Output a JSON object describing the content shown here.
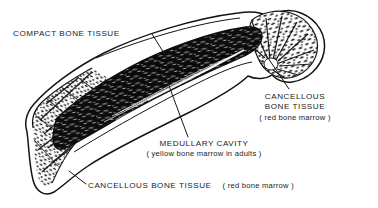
{
  "figure": {
    "kind": "anatomical-line-drawing",
    "width": 378,
    "height": 208,
    "background_color": "#ffffff",
    "ink_color": "#1a1a1a"
  },
  "labels": {
    "compact_bone": {
      "line1": "COMPACT BONE TISSUE"
    },
    "cancellous_right": {
      "line1": "CANCELLOUS",
      "line2": "BONE TISSUE",
      "line3": "( red bone marrow )"
    },
    "medullary": {
      "line1": "MEDULLARY CAVITY",
      "line2": "( yellow bone marrow in adults )"
    },
    "cancellous_bottom": {
      "line1": "CANCELLOUS BONE TISSUE",
      "line2": "( red bone marrow )"
    }
  },
  "leader_lines": [
    {
      "name": "compact-bone-leader",
      "from": [
        152,
        34
      ],
      "to": [
        172,
        66
      ]
    },
    {
      "name": "cancellous-right-leader",
      "from": [
        289,
        89
      ],
      "to": [
        266,
        55
      ]
    },
    {
      "name": "medullary-leader",
      "from": [
        188,
        137
      ],
      "to": [
        165,
        75
      ]
    },
    {
      "name": "cancellous-bottom-leader",
      "from": [
        86,
        184
      ],
      "to": [
        71,
        172
      ]
    }
  ],
  "regions": [
    {
      "name": "compact-bone-tissue",
      "description": "outer dense cortical shell forming the smooth bone outline"
    },
    {
      "name": "medullary-cavity",
      "description": "dark central canal running the length of the diaphysis"
    },
    {
      "name": "cancellous-bone-right",
      "description": "spongy trabecular bone filling the rounded proximal head"
    },
    {
      "name": "cancellous-bone-left",
      "description": "spongy trabecular bone filling the flared distal end"
    }
  ]
}
